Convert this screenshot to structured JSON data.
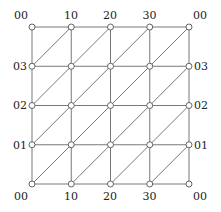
{
  "diagram": {
    "grid_size": 4,
    "origin": [
      32,
      27
    ],
    "spacing": 39.25,
    "node_radius": 3,
    "top_labels": [
      "00",
      "10",
      "20",
      "30",
      "00"
    ],
    "bottom_labels": [
      "00",
      "10",
      "20",
      "30",
      "00"
    ],
    "left_labels": [
      "03",
      "02",
      "01"
    ],
    "right_labels": [
      "03",
      "02",
      "01"
    ],
    "diagonal_direction": "bottom-left-to-top-right",
    "colors": {
      "edge": "#555555",
      "node_fill": "#ffffff",
      "text": "#222222"
    }
  }
}
